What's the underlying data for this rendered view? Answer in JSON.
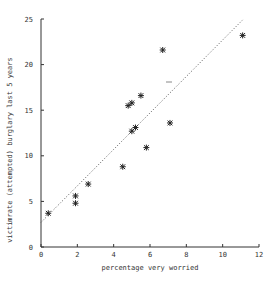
{
  "chart_data": {
    "type": "scatter",
    "title": "",
    "xlabel": "percentage very worried",
    "ylabel": "victimrate (attempted) burglary last 5 years",
    "xlim": [
      0,
      12
    ],
    "ylim": [
      0,
      25
    ],
    "xticks": [
      0,
      2,
      4,
      6,
      8,
      10,
      12
    ],
    "yticks": [
      0,
      5,
      10,
      15,
      20,
      25
    ],
    "grid": false,
    "legend": null,
    "marker": "asterisk",
    "points": [
      {
        "x": 0.4,
        "y": 3.7
      },
      {
        "x": 1.9,
        "y": 5.6
      },
      {
        "x": 1.9,
        "y": 4.8
      },
      {
        "x": 2.6,
        "y": 6.9
      },
      {
        "x": 4.5,
        "y": 8.8
      },
      {
        "x": 4.8,
        "y": 15.5
      },
      {
        "x": 5.0,
        "y": 15.8
      },
      {
        "x": 5.0,
        "y": 12.7
      },
      {
        "x": 5.2,
        "y": 13.1
      },
      {
        "x": 5.5,
        "y": 16.6
      },
      {
        "x": 5.8,
        "y": 10.9
      },
      {
        "x": 6.7,
        "y": 21.6
      },
      {
        "x": 7.1,
        "y": 13.6
      },
      {
        "x": 11.1,
        "y": 23.2
      }
    ],
    "fit_line": {
      "style": "dotted",
      "x0": 0,
      "y0": 2.7,
      "x1": 11.1,
      "y1": 24.9
    }
  }
}
